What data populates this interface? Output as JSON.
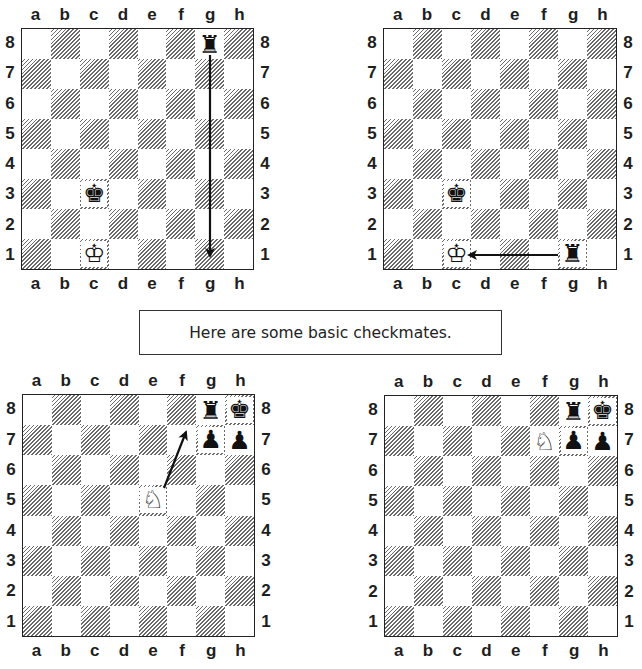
{
  "caption": {
    "text": "Here are some basic checkmates."
  },
  "files": [
    "a",
    "b",
    "c",
    "d",
    "e",
    "f",
    "g",
    "h"
  ],
  "ranks": [
    "8",
    "7",
    "6",
    "5",
    "4",
    "3",
    "2",
    "1"
  ],
  "pieces_glyphs": {
    "black-rook": "♜",
    "black-king": "♚",
    "black-pawn": "♟",
    "white-king": "♔",
    "white-knight": "♘"
  },
  "diagrams": [
    {
      "id": "top-left",
      "title": "Rook moves g8 to g1",
      "board": {
        "left": 21,
        "top": 28,
        "width": 233,
        "height": 242
      },
      "pieces": [
        {
          "square": "g8",
          "type": "black-rook"
        },
        {
          "square": "c3",
          "type": "black-king"
        },
        {
          "square": "c1",
          "type": "white-king"
        }
      ],
      "arrow": {
        "from": "g8",
        "to": "g1",
        "x1": 210,
        "y1": 55,
        "x2": 210,
        "y2": 256
      }
    },
    {
      "id": "top-right",
      "title": "Rook on g1 checks king on c1",
      "board": {
        "left": 383,
        "top": 28,
        "width": 234,
        "height": 242
      },
      "pieces": [
        {
          "square": "c3",
          "type": "black-king"
        },
        {
          "square": "c1",
          "type": "white-king"
        },
        {
          "square": "g1",
          "type": "black-rook"
        }
      ],
      "arrow": {
        "from": "g1",
        "to": "c1",
        "x1": 558,
        "y1": 255,
        "x2": 469,
        "y2": 255
      }
    },
    {
      "id": "bottom-left",
      "title": "Knight e5 to f7",
      "board": {
        "left": 22,
        "top": 394,
        "width": 233,
        "height": 243
      },
      "pieces": [
        {
          "square": "g8",
          "type": "black-rook"
        },
        {
          "square": "h8",
          "type": "black-king"
        },
        {
          "square": "g7",
          "type": "black-pawn"
        },
        {
          "square": "h7",
          "type": "black-pawn"
        },
        {
          "square": "e5",
          "type": "white-knight"
        }
      ],
      "arrow": {
        "from": "e5",
        "to": "f7",
        "x1": 164,
        "y1": 488,
        "x2": 186,
        "y2": 432
      }
    },
    {
      "id": "bottom-right",
      "title": "Smothered mate with knight on f7",
      "board": {
        "left": 384,
        "top": 395,
        "width": 234,
        "height": 242
      },
      "pieces": [
        {
          "square": "g8",
          "type": "black-rook"
        },
        {
          "square": "h8",
          "type": "black-king"
        },
        {
          "square": "f7",
          "type": "white-knight"
        },
        {
          "square": "g7",
          "type": "black-pawn"
        },
        {
          "square": "h7",
          "type": "black-pawn"
        }
      ],
      "arrow": null
    }
  ]
}
